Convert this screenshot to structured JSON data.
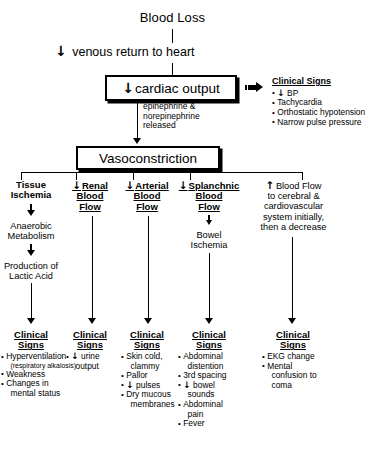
{
  "diagram": {
    "title": "Blood Loss",
    "nodes": {
      "blood_loss": "Blood Loss",
      "venous_return": "venous return to heart",
      "cardiac_output": "cardiac output",
      "epinephrine_note": [
        "epinephrine &",
        "norepinephrine",
        "released"
      ],
      "vasoconstriction": "Vasoconstriction"
    },
    "top_clinical_signs": {
      "heading": "Clinical Signs",
      "items": [
        "BP",
        "Tachycardia",
        "Orthostatic hypotension",
        "Narrow pulse pressure"
      ],
      "first_item_has_down_arrow": true
    },
    "branches": [
      {
        "id": "tissue-ischemia",
        "arrow": "none",
        "header_lines": [
          "Tissue",
          "Ischemia"
        ],
        "mid_nodes": [
          {
            "lines": [
              "Anaerobic",
              "Metabolism"
            ]
          },
          {
            "lines": [
              "Production of",
              "Lactic Acid"
            ]
          }
        ],
        "clinical_signs": {
          "heading_lines": [
            "Clinical",
            "Signs"
          ],
          "items": [
            {
              "text": "Hyperventilation",
              "sub": "(respiratory alkalosis)"
            },
            {
              "text": "Weakness"
            },
            {
              "text": "Changes in",
              "cont": "mental status"
            }
          ]
        }
      },
      {
        "id": "renal-blood-flow",
        "arrow": "down",
        "header_lines": [
          "Renal",
          "Blood",
          "Flow"
        ],
        "mid_nodes": [],
        "clinical_signs": {
          "heading_lines": [
            "Clinical",
            "Signs"
          ],
          "items": [
            {
              "text": "urine",
              "arrow": "down",
              "cont": "output"
            }
          ]
        }
      },
      {
        "id": "arterial-blood-flow",
        "arrow": "down",
        "header_lines": [
          "Arterial",
          "Blood",
          "Flow"
        ],
        "mid_nodes": [],
        "clinical_signs": {
          "heading_lines": [
            "Clinical",
            "Signs"
          ],
          "items": [
            {
              "text": "Skin cold,",
              "cont": "clammy"
            },
            {
              "text": "Pallor"
            },
            {
              "text": "pulses",
              "arrow": "down"
            },
            {
              "text": "Dry mucous",
              "cont": "membranes"
            }
          ]
        }
      },
      {
        "id": "splanchnic-blood-flow",
        "arrow": "down",
        "header_lines": [
          "Splanchnic",
          "Blood",
          "Flow"
        ],
        "mid_nodes": [
          {
            "lines": [
              "Bowel",
              "Ischemia"
            ],
            "arrow": "down"
          }
        ],
        "clinical_signs": {
          "heading_lines": [
            "Clinical",
            "Signs"
          ],
          "items": [
            {
              "text": "Abdominal",
              "cont": "distention"
            },
            {
              "text": "3rd spacing"
            },
            {
              "text": "bowel",
              "arrow": "down",
              "cont": "sounds"
            },
            {
              "text": "Abdominal",
              "cont": "pain"
            },
            {
              "text": "Fever"
            }
          ]
        }
      },
      {
        "id": "cerebral-blood-flow",
        "arrow": "up",
        "header_lines": [
          "Blood Flow",
          "to cerebral &",
          "cardiovascular",
          "system initially,",
          "then a decrease"
        ],
        "mid_nodes": [],
        "clinical_signs": {
          "heading_lines": [
            "Clinical",
            "Signs"
          ],
          "items": [
            {
              "text": "EKG change"
            },
            {
              "text": "Mental",
              "cont": "confusion to",
              "cont2": "coma"
            }
          ]
        }
      }
    ],
    "glyphs": {
      "down_arrow": "↓",
      "up_arrow": "↑",
      "bullet": "•"
    },
    "colors": {
      "ink": "#000000",
      "paper": "#ffffff"
    }
  }
}
